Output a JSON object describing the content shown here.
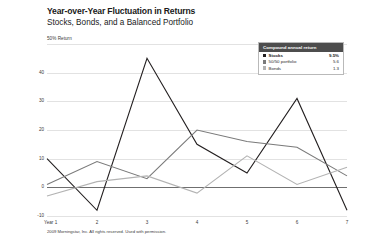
{
  "header": {
    "title": "Year-over-Year Fluctuation in Returns",
    "subtitle": "Stocks, Bonds, and a Balanced Portfolio"
  },
  "legend": {
    "heading": "Compound annual return",
    "rows": [
      {
        "label": "Stocks",
        "value": "9.5%",
        "color": "#231f20",
        "emphasis": true
      },
      {
        "label": "50/50 portfolio",
        "value": "5.6",
        "color": "#7a7a7a",
        "emphasis": false
      },
      {
        "label": "Bonds",
        "value": "1.3",
        "color": "#b3b3b3",
        "emphasis": false
      }
    ]
  },
  "footer": {
    "copyright": "2009 Morningstar, Inc. All rights reserved. Used with permission."
  },
  "chart_data": {
    "type": "line",
    "title": "Year-over-Year Fluctuation in Returns",
    "subtitle": "Stocks, Bonds, and a Balanced Portfolio",
    "xlabel": "",
    "ylabel": "50% Return",
    "axis_title": "50% Return",
    "categories": [
      "Year 1",
      "2",
      "3",
      "4",
      "5",
      "6",
      "7"
    ],
    "x": [
      1,
      2,
      3,
      4,
      5,
      6,
      7
    ],
    "ylim": [
      -10,
      50
    ],
    "yticks": [
      50,
      40,
      30,
      20,
      10,
      0,
      -10
    ],
    "ytick_labels": [
      "",
      "40",
      "30",
      "20",
      "10",
      "0",
      "-10"
    ],
    "grid": true,
    "zero_line": 0,
    "legend_position": "top-right",
    "series": [
      {
        "name": "Stocks",
        "color": "#231f20",
        "compound_annual_return": "9.5%",
        "values": [
          10,
          -8,
          45,
          15,
          5,
          31,
          -8
        ]
      },
      {
        "name": "50/50 portfolio",
        "color": "#7a7a7a",
        "compound_annual_return": "5.6",
        "values": [
          1,
          9,
          3,
          20,
          16,
          14,
          4
        ]
      },
      {
        "name": "Bonds",
        "color": "#b3b3b3",
        "compound_annual_return": "1.3",
        "values": [
          -3,
          2,
          4,
          -2,
          11,
          1,
          7
        ]
      }
    ]
  }
}
